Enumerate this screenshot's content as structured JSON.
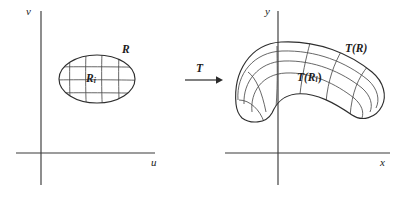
{
  "figure": {
    "stroke_color": "#2e2e2e",
    "background_color": "#ffffff",
    "panels": [
      {
        "name": "uv-plane",
        "axes": {
          "vertical_label": "v",
          "horizontal_label": "u",
          "origin": [
            41,
            153
          ],
          "vertical_extent": [
            11,
            185
          ],
          "horizontal_extent": [
            16,
            155
          ]
        },
        "region": {
          "label": "R",
          "subregion_label_base": "R",
          "subregion_label_subscript": "i",
          "shape": "ellipse",
          "center": [
            97,
            79
          ],
          "radius_x": 38,
          "radius_y": 24,
          "grid_vertical_lines": 4,
          "grid_horizontal_lines": 3
        }
      },
      {
        "name": "xy-plane",
        "axes": {
          "vertical_label": "y",
          "horizontal_label": "x",
          "origin": [
            278,
            153
          ],
          "vertical_extent": [
            11,
            185
          ],
          "horizontal_extent": [
            225,
            390
          ]
        },
        "region": {
          "label_prefix": "T",
          "label": "T(R)",
          "subregion_label": "T(R",
          "subregion_label_subscript": "i",
          "subregion_label_suffix": ")",
          "shape": "curved-arch",
          "grid_transverse_lines": 4,
          "grid_longitudinal_lines": 3
        }
      }
    ],
    "arrow": {
      "label": "T",
      "from_x": 185,
      "to_x": 222,
      "y": 80
    }
  }
}
